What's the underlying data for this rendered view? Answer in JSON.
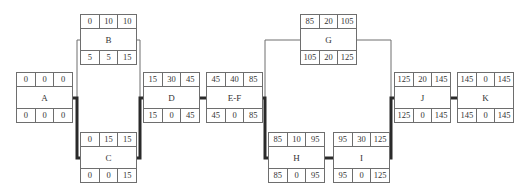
{
  "diagram": {
    "type": "activity-on-node network (critical path)",
    "cell_layout": {
      "top": [
        "ES",
        "Duration",
        "EF"
      ],
      "bottom": [
        "LS",
        "Slack",
        "LF"
      ]
    },
    "nodes": [
      {
        "id": "A",
        "label": "A",
        "top": [
          "0",
          "0",
          "0"
        ],
        "bottom": [
          "0",
          "0",
          "0"
        ],
        "critical": true
      },
      {
        "id": "B",
        "label": "B",
        "top": [
          "0",
          "10",
          "10"
        ],
        "bottom": [
          "5",
          "5",
          "15"
        ],
        "critical": false
      },
      {
        "id": "C",
        "label": "C",
        "top": [
          "0",
          "15",
          "15"
        ],
        "bottom": [
          "0",
          "0",
          "15"
        ],
        "critical": true
      },
      {
        "id": "D",
        "label": "D",
        "top": [
          "15",
          "30",
          "45"
        ],
        "bottom": [
          "15",
          "0",
          "45"
        ],
        "critical": true
      },
      {
        "id": "EF",
        "label": "E-F",
        "top": [
          "45",
          "40",
          "85"
        ],
        "bottom": [
          "45",
          "0",
          "85"
        ],
        "critical": true
      },
      {
        "id": "G",
        "label": "G",
        "top": [
          "85",
          "20",
          "105"
        ],
        "bottom": [
          "105",
          "20",
          "125"
        ],
        "critical": false
      },
      {
        "id": "H",
        "label": "H",
        "top": [
          "85",
          "10",
          "95"
        ],
        "bottom": [
          "85",
          "0",
          "95"
        ],
        "critical": true
      },
      {
        "id": "I",
        "label": "I",
        "top": [
          "95",
          "30",
          "125"
        ],
        "bottom": [
          "95",
          "0",
          "125"
        ],
        "critical": true
      },
      {
        "id": "J",
        "label": "J",
        "top": [
          "125",
          "20",
          "145"
        ],
        "bottom": [
          "125",
          "0",
          "145"
        ],
        "critical": true
      },
      {
        "id": "K",
        "label": "K",
        "top": [
          "145",
          "0",
          "145"
        ],
        "bottom": [
          "145",
          "0",
          "145"
        ],
        "critical": true
      }
    ],
    "edges": [
      {
        "from": "A",
        "to": "B",
        "critical": false
      },
      {
        "from": "A",
        "to": "C",
        "critical": true
      },
      {
        "from": "B",
        "to": "D",
        "critical": false
      },
      {
        "from": "C",
        "to": "D",
        "critical": true
      },
      {
        "from": "D",
        "to": "EF",
        "critical": true
      },
      {
        "from": "EF",
        "to": "G",
        "critical": false
      },
      {
        "from": "EF",
        "to": "H",
        "critical": true
      },
      {
        "from": "H",
        "to": "I",
        "critical": true
      },
      {
        "from": "G",
        "to": "J",
        "critical": false
      },
      {
        "from": "I",
        "to": "J",
        "critical": true
      },
      {
        "from": "J",
        "to": "K",
        "critical": true
      }
    ],
    "colors": {
      "box_border": "#6e6e6e",
      "thin_line": "#6e6e6e",
      "critical_line": "#2a2a2a",
      "text": "#333333"
    }
  }
}
